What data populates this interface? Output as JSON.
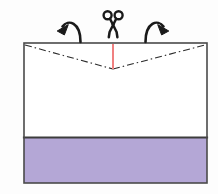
{
  "figure": {
    "background_color": "#fdfdfd",
    "width": 218,
    "height": 194
  },
  "sheet": {
    "name": "rectangular sheet",
    "x": 24,
    "y": 43,
    "width": 183,
    "height": 140,
    "fill_color": "#ffffff",
    "stroke_color": "#4a4a4a",
    "stroke_width": 1.6
  },
  "lower_band": {
    "name": "shaded lower band",
    "x": 24,
    "y": 137,
    "width": 183,
    "height": 46,
    "fill_color": "#b4a7d6",
    "top_edge_color": "#3d3d3d",
    "top_edge_width": 2.2
  },
  "fold_lines": {
    "name": "dash-dot fold lines",
    "style": "dash-dot",
    "dash_pattern": "7 3 1.5 3",
    "stroke_color": "#2b2b2b",
    "stroke_width": 1.1,
    "left_from_x": 25,
    "left_from_y": 45,
    "vertex_x": 113,
    "vertex_y": 69,
    "right_to_x": 205,
    "right_to_y": 45
  },
  "cut_line": {
    "name": "red cut line",
    "color": "#f08080",
    "stroke_width": 2.0,
    "x": 113,
    "y_top": 44,
    "y_bottom": 69
  },
  "scissors": {
    "name": "scissors",
    "color": "#1a1a1a",
    "center_x": 113,
    "top_y": 11,
    "bottom_y": 37,
    "handle_radius": 4.0
  },
  "arrows": [
    {
      "name": "left-fold-arrow",
      "direction": "counter-clockwise-left",
      "color": "#1a1a1a",
      "stroke_width": 2.6
    },
    {
      "name": "right-fold-arrow",
      "direction": "clockwise-right",
      "color": "#1a1a1a",
      "stroke_width": 2.6
    }
  ],
  "labels": {
    "caption": ""
  }
}
